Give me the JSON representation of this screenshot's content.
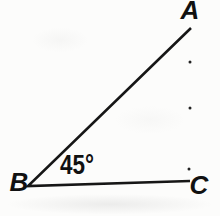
{
  "diagram": {
    "type": "right-triangle",
    "line_color": "#161616",
    "background_color": "#fcfcfb",
    "triangle_points": "191,28 28,186 190,181",
    "vertex_labels": [
      {
        "text": "A",
        "x": 190,
        "y": 19
      },
      {
        "text": "B",
        "x": 19,
        "y": 191
      },
      {
        "text": "C",
        "x": 199,
        "y": 194
      }
    ],
    "angle_label": {
      "text": "45°",
      "at_vertex": "B",
      "x": 60,
      "y": 174,
      "text_length": 34
    },
    "ink_dots": [
      {
        "x": 190,
        "y": 62
      },
      {
        "x": 190,
        "y": 108
      },
      {
        "x": 189,
        "y": 169
      }
    ]
  }
}
